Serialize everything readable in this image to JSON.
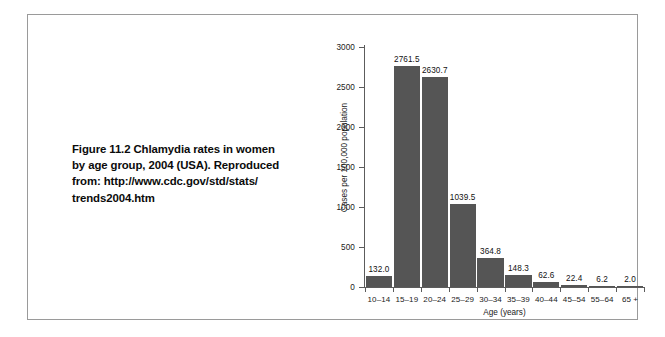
{
  "figure": {
    "caption_lines": [
      "Figure 11.2  Chlamydia rates in women",
      "by age group, 2004 (USA). Reproduced",
      "from: http://www.cdc.gov/std/stats/",
      "trends2004.htm"
    ]
  },
  "colors": {
    "bar": "#555555",
    "axis": "#5c5c5c",
    "frame": "#9a9a9a",
    "text": "#111111"
  },
  "chart_data": {
    "type": "bar",
    "title": "",
    "xlabel": "Age (years)",
    "ylabel": "Cases per 100,000 population",
    "categories": [
      "10–14",
      "15–19",
      "20–24",
      "25–29",
      "30–34",
      "35–39",
      "40–44",
      "45–54",
      "55–64",
      "65 +"
    ],
    "values": [
      132.0,
      2761.5,
      2630.7,
      1039.5,
      364.8,
      148.3,
      62.6,
      22.4,
      6.2,
      2.0
    ],
    "value_labels": [
      "132.0",
      "2761.5",
      "2630.7",
      "1039.5",
      "364.8",
      "148.3",
      "62.6",
      "22.4",
      "6.2",
      "2.0"
    ],
    "ylim": [
      0,
      3000
    ],
    "yticks": [
      0,
      500,
      1000,
      1500,
      2000,
      2500,
      3000
    ],
    "ytick_labels": [
      "0",
      "500",
      "1000",
      "1500",
      "2000",
      "2500",
      "3000"
    ],
    "grid": false,
    "legend": false
  }
}
